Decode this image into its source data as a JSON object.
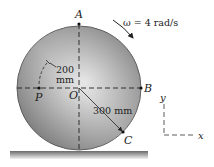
{
  "diagram": {
    "points": {
      "A": "A",
      "B": "B",
      "C": "C",
      "O": "O",
      "P": "P"
    },
    "angular_velocity": "ω = 4 rad/s",
    "dimension_OP": {
      "value": "200",
      "unit": "mm"
    },
    "dimension_OC": "300 mm",
    "axes": {
      "x": "x",
      "y": "y"
    },
    "colors": {
      "disk_dark": "#6e6e6e",
      "disk_light": "#d8d8d8",
      "ground": "#8a8a8a",
      "line": "#222222"
    }
  }
}
